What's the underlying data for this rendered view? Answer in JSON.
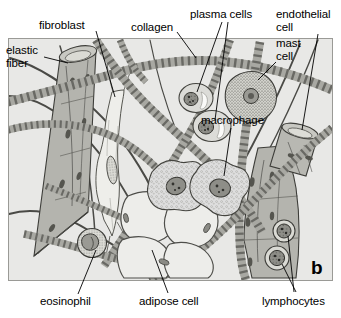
{
  "figure": {
    "panel_letter": "b",
    "caption_subject": "loose connective tissue",
    "background_color": "#ffffff",
    "panel_background_color": "#e8e8e6",
    "panel_border_color": "#9a9a96",
    "ink_color": "#1a1a1a"
  },
  "labels": {
    "elastic_fiber": "elastic\nfiber",
    "fibroblast": "fibroblast",
    "collagen": "collagen",
    "plasma_cells": "plasma cells",
    "endothelial_cell": "endothelial\ncell",
    "mast_cell": "mast\ncell",
    "macrophage": "macrophage",
    "eosinophil": "eosinophil",
    "adipose_cell": "adipose cell",
    "lymphocytes": "lymphocytes"
  },
  "structures": [
    {
      "name": "elastic-fiber",
      "count": 4,
      "description": "thin dark wavy branching fibers"
    },
    {
      "name": "collagen-fiber",
      "count": 7,
      "description": "thick banded striated ribbons"
    },
    {
      "name": "fibroblast",
      "count": 1,
      "description": "pale elongated spindle cell"
    },
    {
      "name": "plasma-cell",
      "count": 2,
      "description": "round cell, eccentric nucleus with clear halo"
    },
    {
      "name": "mast-cell",
      "count": 1,
      "description": "granular stippled irregular cell"
    },
    {
      "name": "macrophage",
      "count": 2,
      "description": "amoeboid cell with pseudopods and vacuoles"
    },
    {
      "name": "eosinophil",
      "count": 1,
      "description": "round granular cell with bilobed nucleus"
    },
    {
      "name": "adipose-cell",
      "count": 4,
      "description": "large empty polygonal fat cells"
    },
    {
      "name": "lymphocyte",
      "count": 2,
      "description": "small round cell with large dark nucleus"
    },
    {
      "name": "capillary",
      "count": 2,
      "description": "cut tube lined by endothelial cells"
    }
  ],
  "colors": {
    "vessel_fill": "#b4b4ae",
    "collagen_fill": "#a8a8a2",
    "collagen_band": "#6a6a65",
    "elastic_fiber": "#4a4a46",
    "cell_fill": "#dcdcd8",
    "nucleus_fill": "#8e8e88",
    "fat_fill": "#e6e6e2"
  }
}
